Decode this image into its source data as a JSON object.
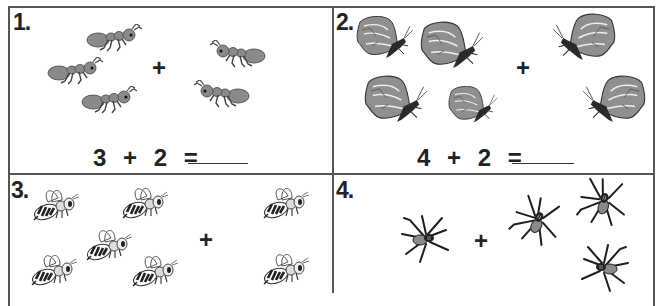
{
  "worksheet": {
    "problems": [
      {
        "number": "1.",
        "animal": "ant",
        "left_count": 3,
        "right_count": 2,
        "operator": "+",
        "equation": {
          "a": "3",
          "op": "+",
          "b": "2",
          "eq": "=",
          "answer": ""
        }
      },
      {
        "number": "2.",
        "animal": "butterfly",
        "left_count": 4,
        "right_count": 2,
        "operator": "+",
        "equation": {
          "a": "4",
          "op": "+",
          "b": "2",
          "eq": "=",
          "answer": ""
        }
      },
      {
        "number": "3.",
        "animal": "bee",
        "left_count": 5,
        "right_count": 2,
        "operator": "+"
      },
      {
        "number": "4.",
        "animal": "spider",
        "left_count": 1,
        "right_count": 3,
        "operator": "+"
      }
    ],
    "colors": {
      "border": "#555555",
      "text": "#222222",
      "insect_fill": "#8a8a8a",
      "insect_dark": "#2a2a2a"
    }
  }
}
